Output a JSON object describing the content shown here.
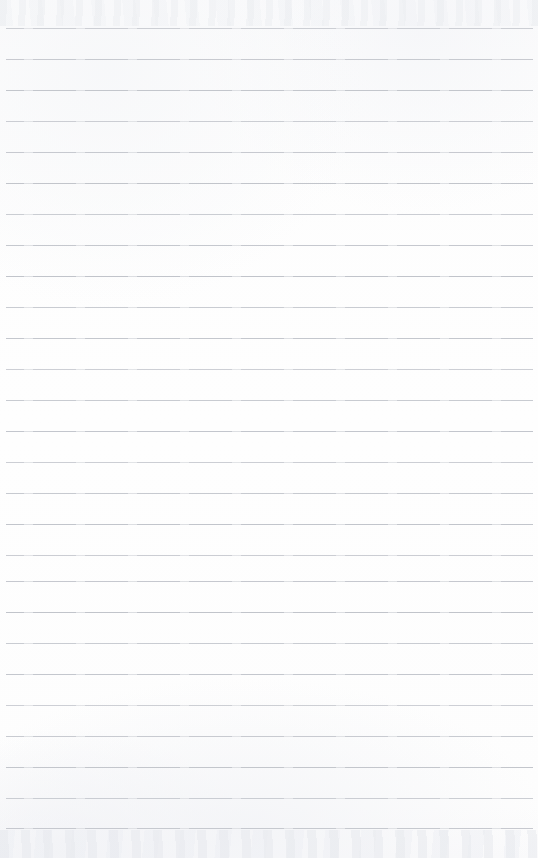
{
  "document": {
    "type": "lined-notebook-paper",
    "title": "Blank ruled paper sheet",
    "content_text": "",
    "width_px": 538,
    "height_px": 858,
    "is_blank": true
  },
  "paper": {
    "background_color": "#fdfdfd",
    "edge_texture_color": "#eceef2"
  },
  "ruling": {
    "line_color": "#c0c3ca",
    "line_thickness_px": 1,
    "line_spacing_px": 31,
    "first_line_y_px": 28,
    "last_line_y_px": 828,
    "line_start_x_px": 6,
    "line_end_x_px": 533,
    "line_count": 27,
    "lines_y": [
      28,
      59,
      90,
      121,
      152,
      183,
      214,
      245,
      276,
      307,
      338,
      369,
      400,
      431,
      462,
      493,
      524,
      555,
      581,
      612,
      643,
      674,
      705,
      736,
      767,
      798,
      828
    ],
    "has_margin_rule": false,
    "has_punch_holes": false
  }
}
